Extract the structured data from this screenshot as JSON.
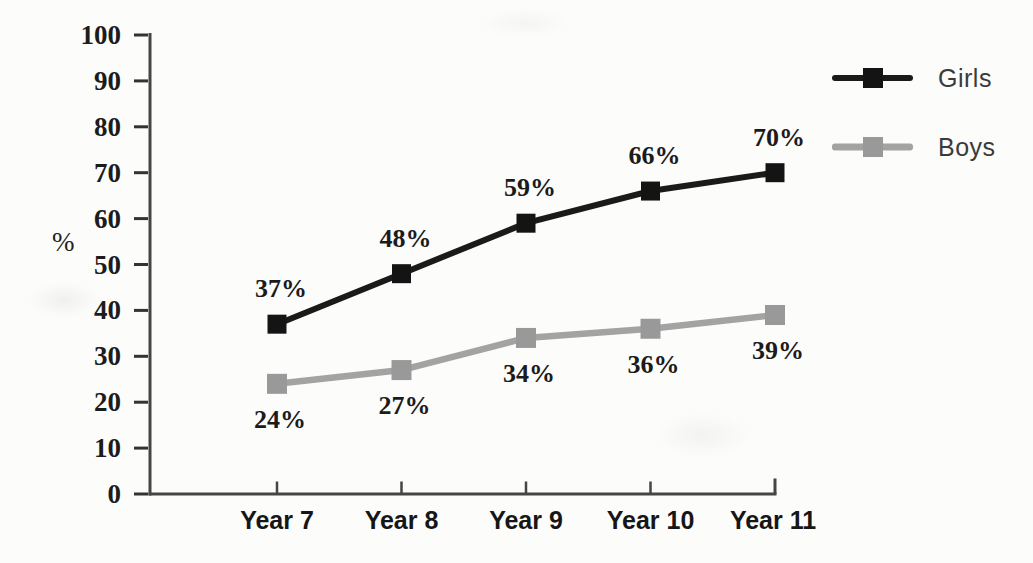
{
  "figure": {
    "background": "#fcfcfb"
  },
  "chart_data": {
    "type": "line",
    "title": "",
    "xlabel": "",
    "ylabel": "%",
    "categories": [
      "Year 7",
      "Year 8",
      "Year 9",
      "Year 10",
      "Year 11"
    ],
    "series": [
      {
        "name": "Girls",
        "values": [
          37,
          48,
          59,
          66,
          70
        ],
        "labels": [
          "37%",
          "48%",
          "59%",
          "66%",
          "70%"
        ],
        "color": "#1a1a1a",
        "marker_color": "#141414",
        "marker": "square",
        "label_side": "above"
      },
      {
        "name": "Boys",
        "values": [
          24,
          27,
          34,
          36,
          39
        ],
        "labels": [
          "24%",
          "27%",
          "34%",
          "36%",
          "39%"
        ],
        "color": "#a3a3a3",
        "marker_color": "#999999",
        "marker": "square",
        "label_side": "below"
      }
    ],
    "y_ticks": [
      0,
      10,
      20,
      30,
      40,
      50,
      60,
      70,
      80,
      90,
      100
    ],
    "ylim": [
      0,
      100
    ],
    "grid": false,
    "legend_position": "right",
    "axis_color": "#454545",
    "tick_color": "#333333",
    "text_color": "#1c1c1c"
  }
}
